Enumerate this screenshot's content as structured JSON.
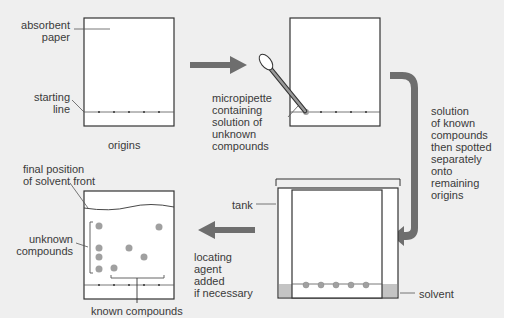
{
  "diagram": {
    "colors": {
      "background": "#efefef",
      "paper": "#ffffff",
      "outline": "#333333",
      "arrow": "#6e6e6e",
      "spot": "#a0a0a0",
      "solvent": "#c4c4c4"
    },
    "panels": [
      {
        "id": "panel-1",
        "labels": {
          "paper": "absorbent\npaper",
          "line": "starting\nline",
          "origins": "origins"
        }
      },
      {
        "id": "panel-2",
        "labels": {
          "pipette": "micropipette\ncontaining\nsolution of\nunknown\ncompounds"
        }
      },
      {
        "id": "panel-3",
        "labels": {
          "tank": "tank",
          "solvent": "solvent"
        }
      },
      {
        "id": "panel-4",
        "labels": {
          "front": "final position\nof solvent front",
          "unknown": "unknown\ncompounds",
          "known": "known compounds"
        }
      }
    ],
    "steps": {
      "step_2_to_3": "solution\nof known\ncompounds\nthen spotted\nseparately\nonto\nremaining\norigins",
      "step_3_to_4": "locating\nagent\nadded\nif necessary"
    }
  }
}
